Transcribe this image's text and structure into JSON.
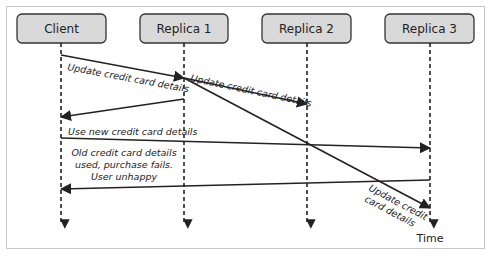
{
  "diagram": {
    "type": "sequence",
    "participants": [
      {
        "id": "client",
        "label": "Client"
      },
      {
        "id": "replica1",
        "label": "Replica 1"
      },
      {
        "id": "replica2",
        "label": "Replica 2"
      },
      {
        "id": "replica3",
        "label": "Replica 3"
      }
    ],
    "messages": [
      {
        "from": "client",
        "to": "replica1",
        "label": "Update credit card details"
      },
      {
        "from": "replica1",
        "to": "replica2",
        "label": "Update credit card details"
      },
      {
        "from": "replica1",
        "to": "client",
        "label": ""
      },
      {
        "from": "client",
        "to": "replica3",
        "label": "Use new credit card details"
      },
      {
        "from": "replica3",
        "to": "client",
        "label_lines": [
          "Old credit card details",
          "used, purchase fails.",
          "User unhappy"
        ]
      },
      {
        "from": "replica1",
        "to": "replica3",
        "label_lines": [
          "Update credit",
          "card details"
        ]
      }
    ],
    "time_label": "Time",
    "colors": {
      "box_fill": "#d9d9d9",
      "box_stroke": "#333333",
      "line": "#222222",
      "frame": "#c8c8c8"
    }
  }
}
